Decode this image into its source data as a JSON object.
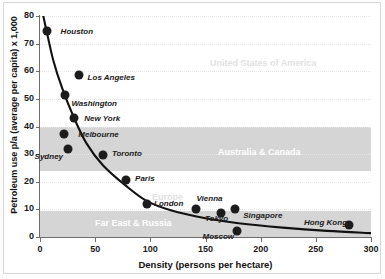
{
  "chart_data": {
    "type": "scatter",
    "title": "",
    "xlabel": "Density (persons per hectare)",
    "ylabel": "Petroleum use p/a (average per capita) x 1,000",
    "xlim": [
      0,
      300
    ],
    "ylim": [
      0,
      80
    ],
    "xticks": [
      0,
      50,
      100,
      150,
      200,
      250,
      300
    ],
    "yticks": [
      0,
      10,
      20,
      30,
      40,
      50,
      60,
      70,
      80
    ],
    "grid": true,
    "legend": "none",
    "points": [
      {
        "label": "Houston",
        "x": 6,
        "y": 74.5,
        "lx": 14,
        "ly": 0
      },
      {
        "label": "Los Angeles",
        "x": 35,
        "y": 58.5,
        "lx": 9,
        "ly": 2
      },
      {
        "label": "Washington",
        "x": 23,
        "y": 51.5,
        "lx": 6,
        "ly": 8
      },
      {
        "label": "New York",
        "x": 31,
        "y": 43,
        "lx": 10,
        "ly": 0
      },
      {
        "label": "Melbourne",
        "x": 22,
        "y": 37.3,
        "lx": 14,
        "ly": 0
      },
      {
        "label": "Sydney",
        "x": 25,
        "y": 32,
        "lx": -33,
        "ly": 7
      },
      {
        "label": "Toronto",
        "x": 57,
        "y": 29.8,
        "lx": 9,
        "ly": -2
      },
      {
        "label": "Paris",
        "x": 78,
        "y": 20.5,
        "lx": 9,
        "ly": -2
      },
      {
        "label": "London",
        "x": 97,
        "y": 11.8,
        "lx": 7,
        "ly": -1
      },
      {
        "label": "Vienna",
        "x": 141,
        "y": 10,
        "lx": 1,
        "ly": -11
      },
      {
        "label": "Tokyo",
        "x": 164,
        "y": 8.7,
        "lx": -16,
        "ly": 5
      },
      {
        "label": "Singapore",
        "x": 177,
        "y": 10,
        "lx": 8,
        "ly": 6
      },
      {
        "label": "Moscow",
        "x": 179,
        "y": 2.3,
        "lx": -35,
        "ly": 5
      },
      {
        "label": "Hong Kong",
        "x": 280,
        "y": 4.5,
        "lx": -45,
        "ly": -3
      }
    ],
    "trend_curve": {
      "description": "decreasing power-law fit through the city scatter",
      "points": [
        {
          "x": 3,
          "y": 80
        },
        {
          "x": 6,
          "y": 74.5
        },
        {
          "x": 12,
          "y": 64
        },
        {
          "x": 20,
          "y": 54
        },
        {
          "x": 31,
          "y": 43
        },
        {
          "x": 42,
          "y": 34
        },
        {
          "x": 57,
          "y": 26
        },
        {
          "x": 78,
          "y": 18.5
        },
        {
          "x": 97,
          "y": 13
        },
        {
          "x": 120,
          "y": 9.5
        },
        {
          "x": 150,
          "y": 6.8
        },
        {
          "x": 180,
          "y": 5
        },
        {
          "x": 220,
          "y": 3.4
        },
        {
          "x": 260,
          "y": 2.2
        },
        {
          "x": 300,
          "y": 1.4
        }
      ]
    },
    "regions": [
      {
        "name": "United States of America",
        "style": "on-white",
        "xband": [
          0,
          300
        ],
        "yband": null,
        "lx": 210,
        "ly": 58
      },
      {
        "name": "Australia & Canada",
        "style": "on-band",
        "xband": [
          0,
          300
        ],
        "yband": [
          24,
          40
        ],
        "lx": 218,
        "ly": 147
      },
      {
        "name": "Europe",
        "style": "on-white",
        "xband": [
          0,
          300
        ],
        "yband": null,
        "lx": 152,
        "ly": 192
      },
      {
        "name": "Far East & Russia",
        "style": "on-band",
        "xband": [
          0,
          300
        ],
        "yband": [
          0,
          9.5
        ],
        "lx": 95,
        "ly": 218
      }
    ],
    "shaded_bands": [
      {
        "name": "Australia & Canada",
        "y_from": 24,
        "y_to": 40,
        "color": "#d5d5d5"
      },
      {
        "name": "Far East & Russia",
        "y_from": 0,
        "y_to": 9.5,
        "color": "#d5d5d5"
      }
    ],
    "colors": {
      "marker": "#1c1c1c",
      "curve": "#111111",
      "band": "#d5d5d5",
      "axis": "#6d6d6d",
      "grid": "#e6e6e6",
      "region_on_band_text": "#ffffff",
      "region_on_white_text": "#e2e2e2"
    }
  }
}
